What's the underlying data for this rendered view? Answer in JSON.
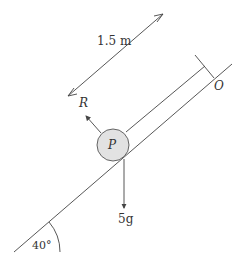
{
  "diagram": {
    "type": "inclined-plane-force-diagram",
    "labels": {
      "distance": "1.5 m",
      "reaction": "R",
      "particle": "P",
      "weight": "5g",
      "point": "O",
      "angle": "40°"
    },
    "colors": {
      "line": "#444444",
      "particle_fill": "#e2e2e2",
      "text": "#333333"
    },
    "geometry": {
      "incline_angle_deg": 40,
      "distance_m": 1.5
    }
  }
}
